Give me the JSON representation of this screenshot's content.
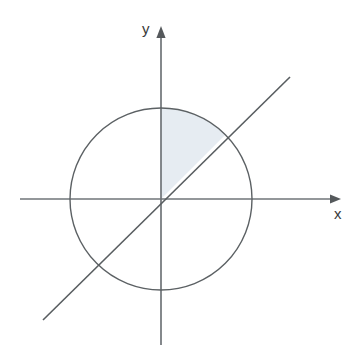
{
  "figure": {
    "title": "",
    "background_color": "#ffffff",
    "width": 353,
    "height": 350,
    "axes": {
      "x_label": "x",
      "y_label": "y",
      "origin": {
        "x": 161,
        "y": 199
      },
      "line_color": "#6f7478",
      "line_width": 1.6,
      "x_axis": {
        "start_x": 20,
        "end_x": 341,
        "arrow": "right"
      },
      "y_axis": {
        "start_y": 345,
        "end_y": 27,
        "arrow": "up"
      }
    },
    "circle": {
      "center_x": 161,
      "center_y": 199,
      "radius": 91,
      "stroke_color": "#5c6164",
      "stroke_width": 1.4,
      "fill": "none"
    },
    "diagonal_line": {
      "description": "line y = x through the origin",
      "slope": 1,
      "x1": 43,
      "y1": 320,
      "x2": 290,
      "y2": 77,
      "stroke_color": "#585d60",
      "stroke_width": 1.6
    },
    "shaded_sector": {
      "description": "circular sector between 45 degrees and 90 degrees",
      "start_angle_deg": 45,
      "end_angle_deg": 90,
      "fill_color": "#e6ecf2",
      "center_x": 161,
      "center_y": 199,
      "radius": 91
    }
  },
  "chart_data": {
    "type": "scatter",
    "title": "",
    "xlabel": "x",
    "ylabel": "y",
    "grid": false,
    "legend": null,
    "xlim": [
      -1.55,
      1.98
    ],
    "ylim": [
      -1.6,
      1.89
    ],
    "annotations": [
      {
        "kind": "axis-arrow",
        "label": "x",
        "direction": "right"
      },
      {
        "kind": "axis-arrow",
        "label": "y",
        "direction": "up"
      }
    ],
    "series": [
      {
        "name": "unit circle",
        "kind": "circle",
        "center": [
          0,
          0
        ],
        "radius": 1
      },
      {
        "name": "line y = x",
        "kind": "line",
        "slope": 1,
        "intercept": 0,
        "x": [
          -1.3,
          1.42
        ],
        "values": [
          -1.3,
          1.42
        ]
      },
      {
        "name": "shaded sector 45deg to 90deg",
        "kind": "sector",
        "center": [
          0,
          0
        ],
        "radius": 1,
        "angles_deg": [
          45,
          90
        ],
        "fill": "#e6ecf2"
      }
    ]
  }
}
